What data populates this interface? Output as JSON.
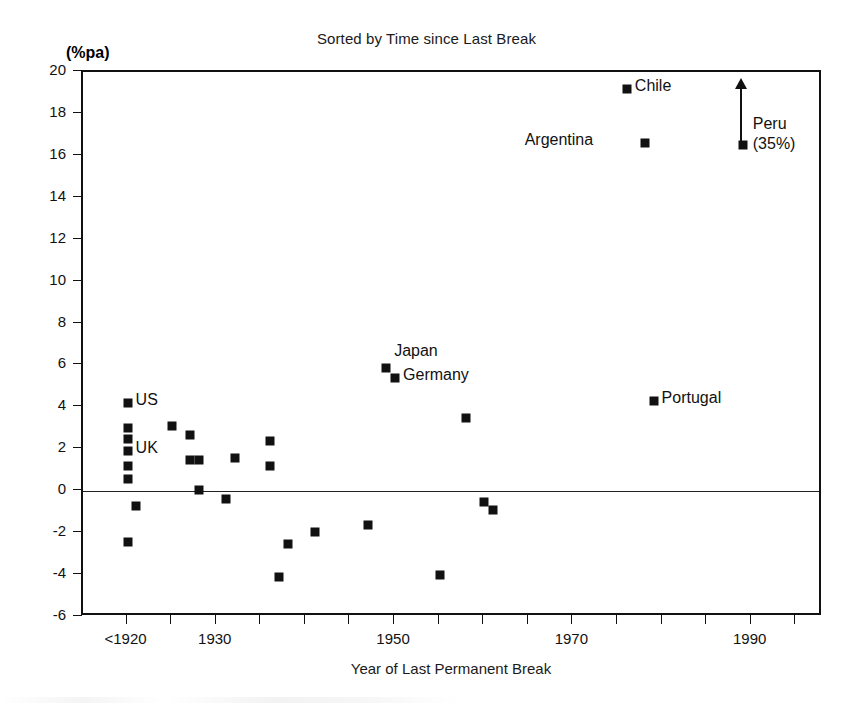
{
  "chart_data": {
    "type": "scatter",
    "title": "Sorted by Time since Last Break",
    "xlabel": "Year of Last Permanent Break",
    "ylabel": "(%pa)",
    "xlim": [
      1915,
      1998
    ],
    "ylim": [
      -6,
      20
    ],
    "ytick_values": [
      20,
      18,
      16,
      14,
      12,
      10,
      8,
      6,
      4,
      2,
      0,
      -2,
      -4,
      -6
    ],
    "ytick_labels": [
      "20",
      "18",
      "16",
      "14",
      "12",
      "10",
      "8",
      "6",
      "4",
      "2",
      "0",
      "-2",
      "-4",
      "-6"
    ],
    "xtick_values": [
      1920,
      1925,
      1930,
      1935,
      1940,
      1945,
      1950,
      1955,
      1960,
      1965,
      1970,
      1975,
      1980,
      1985,
      1990,
      1995
    ],
    "xtick_labeled": [
      {
        "value": 1920,
        "label": "<1920"
      },
      {
        "value": 1930,
        "label": "1930"
      },
      {
        "value": 1950,
        "label": "1950"
      },
      {
        "value": 1970,
        "label": "1970"
      },
      {
        "value": 1990,
        "label": "1990"
      }
    ],
    "grid": false,
    "legend": "none",
    "zero_reference_line": 0,
    "marker_style": "filled-square",
    "marker_color": "#111111",
    "points": [
      {
        "x": 1920,
        "y": 4.2,
        "label": "US",
        "label_pos": "right"
      },
      {
        "x": 1920,
        "y": 3.0,
        "label": "",
        "label_pos": ""
      },
      {
        "x": 1920,
        "y": 2.5,
        "label": "",
        "label_pos": ""
      },
      {
        "x": 1920,
        "y": 1.9,
        "label": "UK",
        "label_pos": "right"
      },
      {
        "x": 1920,
        "y": 1.2,
        "label": "",
        "label_pos": ""
      },
      {
        "x": 1920,
        "y": 0.6,
        "label": "",
        "label_pos": ""
      },
      {
        "x": 1921,
        "y": -0.7,
        "label": "",
        "label_pos": ""
      },
      {
        "x": 1920,
        "y": -2.4,
        "label": "",
        "label_pos": ""
      },
      {
        "x": 1925,
        "y": 3.1,
        "label": "",
        "label_pos": ""
      },
      {
        "x": 1927,
        "y": 2.7,
        "label": "",
        "label_pos": ""
      },
      {
        "x": 1927,
        "y": 1.5,
        "label": "",
        "label_pos": ""
      },
      {
        "x": 1928,
        "y": 1.5,
        "label": "",
        "label_pos": ""
      },
      {
        "x": 1928,
        "y": 0.05,
        "label": "",
        "label_pos": ""
      },
      {
        "x": 1931,
        "y": -0.35,
        "label": "",
        "label_pos": ""
      },
      {
        "x": 1932,
        "y": 1.6,
        "label": "",
        "label_pos": ""
      },
      {
        "x": 1936,
        "y": 2.4,
        "label": "",
        "label_pos": ""
      },
      {
        "x": 1936,
        "y": 1.2,
        "label": "",
        "label_pos": ""
      },
      {
        "x": 1938,
        "y": -2.5,
        "label": "",
        "label_pos": ""
      },
      {
        "x": 1937,
        "y": -4.1,
        "label": "",
        "label_pos": ""
      },
      {
        "x": 1941,
        "y": -1.95,
        "label": "",
        "label_pos": ""
      },
      {
        "x": 1947,
        "y": -1.6,
        "label": "",
        "label_pos": ""
      },
      {
        "x": 1949,
        "y": 5.9,
        "label": "Japan",
        "label_pos": "above-right"
      },
      {
        "x": 1950,
        "y": 5.4,
        "label": "Germany",
        "label_pos": "right"
      },
      {
        "x": 1955,
        "y": -4.0,
        "label": "",
        "label_pos": ""
      },
      {
        "x": 1958,
        "y": 3.5,
        "label": "",
        "label_pos": ""
      },
      {
        "x": 1960,
        "y": -0.5,
        "label": "",
        "label_pos": ""
      },
      {
        "x": 1961,
        "y": -0.9,
        "label": "",
        "label_pos": ""
      },
      {
        "x": 1976,
        "y": 19.2,
        "label": "Chile",
        "label_pos": "right"
      },
      {
        "x": 1978,
        "y": 16.6,
        "label": "Argentina",
        "label_pos": "left"
      },
      {
        "x": 1979,
        "y": 4.3,
        "label": "Portugal",
        "label_pos": "right"
      },
      {
        "x": 1989,
        "y": 16.5,
        "label": "Peru (35%)",
        "label_pos": "right-two-line",
        "annotation": "up-arrow-offscale"
      }
    ],
    "annotations": [
      {
        "name": "peru-arrow",
        "type": "arrow",
        "direction": "up",
        "x": 1989,
        "y_from": 16.5,
        "note": "value exceeds axis maximum"
      },
      {
        "name": "peru-value",
        "text": "(35%)"
      }
    ]
  },
  "labels": {
    "us": "US",
    "uk": "UK",
    "japan": "Japan",
    "germany": "Germany",
    "chile": "Chile",
    "argentina": "Argentina",
    "portugal": "Portugal",
    "peru": "Peru",
    "peru_value": "(35%)"
  }
}
